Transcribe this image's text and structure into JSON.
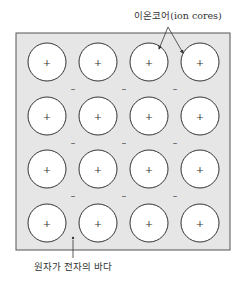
{
  "diagram": {
    "title_label": "이온코어(ion cores)",
    "bottom_label": "원자가 전자의 바다",
    "ion_symbol": "+",
    "electron_symbol": "–",
    "grid": {
      "rows": 4,
      "cols": 4
    },
    "colors": {
      "background": "#e6e6e6",
      "border": "#555555",
      "ion_fill": "#ffffff",
      "ion_stroke": "#333333",
      "text": "#333333"
    },
    "electron_rows_between": [
      1,
      2,
      3
    ],
    "electron_gaps_per_row": 3
  }
}
